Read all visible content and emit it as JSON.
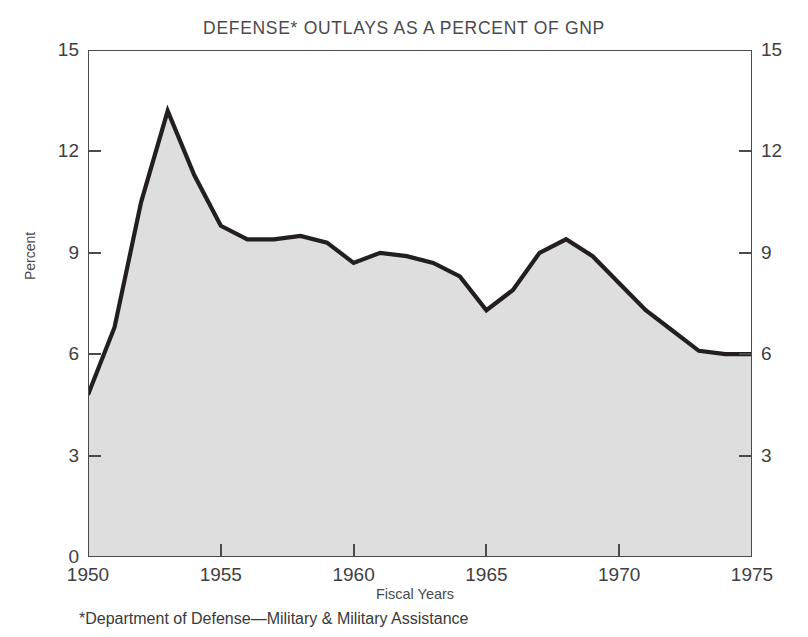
{
  "chart_data": {
    "type": "area",
    "title": "DEFENSE* OUTLAYS AS A PERCENT OF GNP",
    "xlabel": "Fiscal Years",
    "ylabel": "Percent",
    "footnote": "*Department of Defense—Military & Military Assistance",
    "xlim": [
      1950,
      1975
    ],
    "ylim": [
      0,
      15
    ],
    "grid": false,
    "legend": null,
    "y_ticks": [
      0,
      3,
      6,
      9,
      12,
      15
    ],
    "y_tick_labels": [
      "0",
      "3",
      "6",
      "9",
      "12",
      "15"
    ],
    "y_axis_right_labels": [
      "0",
      "3",
      "6",
      "9",
      "12",
      "15"
    ],
    "x_ticks": [
      1950,
      1955,
      1960,
      1965,
      1970,
      1975
    ],
    "x_tick_labels": [
      "1950",
      "1955",
      "1960",
      "1965",
      "1970",
      "1975"
    ],
    "x": [
      1950,
      1951,
      1952,
      1953,
      1954,
      1955,
      1956,
      1957,
      1958,
      1959,
      1960,
      1961,
      1962,
      1963,
      1964,
      1965,
      1966,
      1967,
      1968,
      1969,
      1970,
      1971,
      1972,
      1973,
      1974,
      1975
    ],
    "values": [
      4.8,
      6.8,
      10.5,
      13.2,
      11.3,
      9.8,
      9.4,
      9.4,
      9.5,
      9.3,
      8.7,
      9.0,
      8.9,
      8.7,
      8.3,
      7.3,
      7.9,
      9.0,
      9.4,
      8.9,
      8.1,
      7.3,
      6.7,
      6.1,
      6.0,
      6.0
    ],
    "series": [
      {
        "name": "Defense outlays as percent of GNP",
        "values": [
          4.8,
          6.8,
          10.5,
          13.2,
          11.3,
          9.8,
          9.4,
          9.4,
          9.5,
          9.3,
          8.7,
          9.0,
          8.9,
          8.7,
          8.3,
          7.3,
          7.9,
          9.0,
          9.4,
          8.9,
          8.1,
          7.3,
          6.7,
          6.1,
          6.0,
          6.0
        ]
      }
    ],
    "colors": {
      "area_fill": "#dedede",
      "line": "#231f20",
      "axis": "#4a4a4a",
      "text": "#3a3a3a",
      "background": "#ffffff"
    },
    "annotations": []
  }
}
